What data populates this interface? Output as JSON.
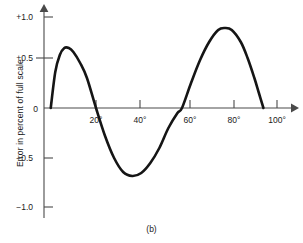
{
  "figure": {
    "caption": "(b)",
    "y_axis_title": "Error in percent of full scale"
  },
  "chart_data": {
    "type": "line",
    "title": "",
    "subtitle": "",
    "caption": "(b)",
    "xlabel": "",
    "ylabel": "Error in percent of full scale",
    "xlim": [
      -4,
      112
    ],
    "ylim": [
      -1.15,
      1.15
    ],
    "grid": false,
    "legend": null,
    "x_tick_labels": [
      "20°",
      "40°",
      "60°",
      "80°",
      "100°"
    ],
    "x_tick_values": [
      20,
      40,
      60,
      80,
      100
    ],
    "y_tick_labels": [
      "+1.0",
      "+0.5",
      "0",
      "−0.5",
      "−1.0"
    ],
    "y_tick_values": [
      1.0,
      0.5,
      0,
      -0.5,
      -1.0
    ],
    "axis_style": "arrowed-axes",
    "series": [
      {
        "name": "Error curve",
        "color": "#151515",
        "x": [
          0,
          2,
          4,
          6,
          8,
          10,
          13,
          16,
          20,
          24,
          28,
          32,
          36,
          40,
          44,
          48,
          52,
          56,
          58,
          62,
          66,
          70,
          74,
          77,
          80,
          84,
          87,
          90,
          92,
          94
        ],
        "y": [
          0.0,
          0.36,
          0.53,
          0.6,
          0.6,
          0.56,
          0.45,
          0.3,
          0.0,
          -0.28,
          -0.5,
          -0.64,
          -0.68,
          -0.65,
          -0.55,
          -0.4,
          -0.2,
          -0.05,
          0.0,
          0.25,
          0.48,
          0.66,
          0.78,
          0.8,
          0.78,
          0.66,
          0.5,
          0.3,
          0.15,
          0.0
        ]
      }
    ],
    "annotations": {
      "first_peak": {
        "x": 7,
        "y": 0.6
      },
      "trough": {
        "x": 36,
        "y": -0.68
      },
      "second_peak": {
        "x": 77,
        "y": 0.8
      },
      "zero_crossings": [
        0,
        20,
        58,
        94
      ]
    }
  }
}
